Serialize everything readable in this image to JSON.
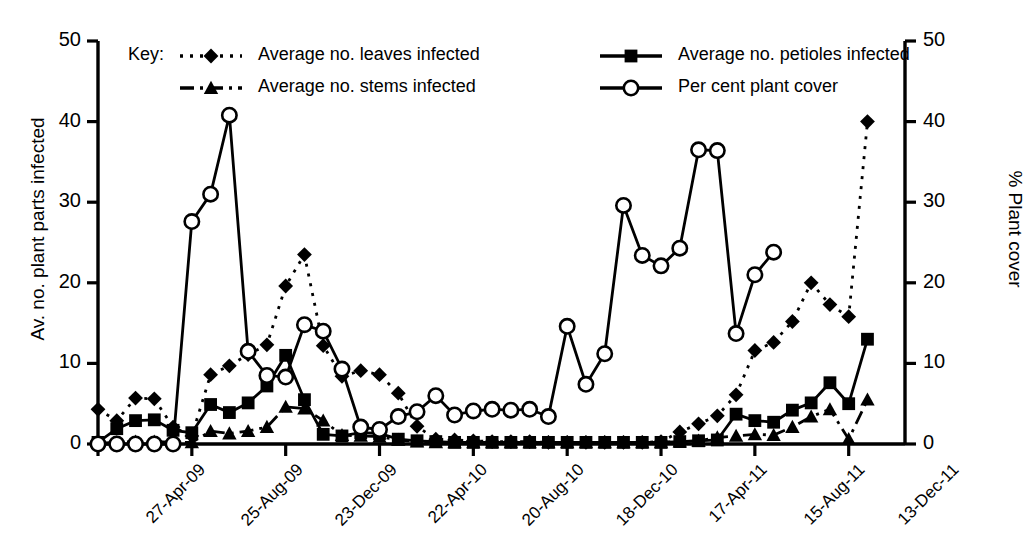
{
  "chart_data": {
    "type": "line",
    "title": "",
    "xlabel": "",
    "ylabel": "Av. no. plant parts infected",
    "y2label": "% Plant cover",
    "ylim": [
      0,
      50
    ],
    "y2lim": [
      0,
      50
    ],
    "yticks": [
      0,
      10,
      20,
      30,
      40,
      50
    ],
    "y2ticks": [
      0,
      10,
      20,
      30,
      40,
      50
    ],
    "grid": false,
    "legend_position": "top-inside",
    "legend_title": "Key:",
    "x_tick_labels": [
      "27-Apr-09",
      "25-Aug-09",
      "23-Dec-09",
      "22-Apr-10",
      "20-Aug-10",
      "18-Dec-10",
      "17-Apr-11",
      "15-Aug-11",
      "13-Dec-11"
    ],
    "x_tick_indices": [
      0,
      5,
      10,
      15,
      20,
      25,
      30,
      35,
      40
    ],
    "n_points": 44,
    "series": [
      {
        "name": "Average no. leaves infected",
        "marker": "diamond",
        "line": "dotted",
        "axis": "left",
        "color": "#000000",
        "values": [
          4.3,
          2.9,
          5.7,
          5.6,
          2.1,
          1.0,
          8.6,
          9.7,
          11.1,
          12.3,
          19.6,
          23.5,
          12.2,
          8.4,
          9.1,
          8.6,
          6.3,
          2.2,
          0.6,
          0.5,
          0.4,
          0.3,
          0.3,
          0.3,
          0.2,
          0.2,
          0.2,
          0.2,
          0.2,
          0.2,
          0.3,
          1.5,
          2.5,
          3.5,
          6.1,
          11.6,
          12.6,
          15.2,
          20.0,
          17.3,
          15.8,
          40.0
        ]
      },
      {
        "name": "Average no. petioles infected",
        "marker": "square",
        "line": "solid",
        "axis": "left",
        "color": "#000000",
        "values": [
          0.2,
          1.9,
          2.9,
          3.0,
          1.7,
          1.4,
          4.9,
          3.9,
          5.1,
          7.2,
          11.0,
          5.5,
          1.2,
          1.0,
          1.4,
          1.3,
          0.6,
          0.4,
          0.3,
          0.2,
          0.2,
          0.2,
          0.2,
          0.2,
          0.2,
          0.2,
          0.2,
          0.2,
          0.2,
          0.2,
          0.2,
          0.3,
          0.4,
          0.5,
          3.7,
          2.9,
          2.7,
          4.2,
          5.1,
          7.6,
          5.0,
          13.0
        ]
      },
      {
        "name": "Average no. stems infected",
        "marker": "triangle",
        "line": "dash-dot",
        "axis": "left",
        "color": "#000000",
        "values": [
          0.1,
          0.2,
          0.3,
          0.3,
          0.2,
          0.2,
          1.6,
          1.3,
          1.6,
          2.1,
          4.6,
          4.4,
          2.9,
          1.1,
          1.0,
          0.9,
          0.5,
          0.3,
          0.2,
          0.2,
          0.2,
          0.2,
          0.2,
          0.2,
          0.2,
          0.2,
          0.2,
          0.2,
          0.2,
          0.2,
          0.2,
          0.3,
          0.4,
          0.8,
          1.0,
          1.2,
          1.1,
          2.1,
          3.4,
          4.3,
          0.6,
          5.5
        ]
      },
      {
        "name": "Per cent plant cover",
        "marker": "circle-open",
        "line": "solid",
        "axis": "right",
        "color": "#000000",
        "values": [
          0.0,
          0.0,
          0.0,
          0.0,
          0.0,
          27.6,
          31.0,
          40.8,
          11.5,
          8.5,
          8.3,
          14.8,
          14.0,
          9.3,
          2.1,
          1.8,
          3.4,
          4.0,
          6.0,
          3.6,
          4.1,
          4.3,
          4.2,
          4.3,
          3.4,
          14.6,
          7.4,
          11.2,
          29.6,
          23.4,
          22.1,
          24.3,
          36.5,
          36.4,
          13.7,
          21.0,
          23.8
        ]
      }
    ]
  },
  "legend": {
    "key_label": "Key:",
    "entries": [
      {
        "label": "Average no. leaves infected",
        "marker": "diamond",
        "line": "dotted"
      },
      {
        "label": "Average no. petioles infected",
        "marker": "square",
        "line": "solid"
      },
      {
        "label": "Average no. stems infected",
        "marker": "triangle",
        "line": "dash-dot"
      },
      {
        "label": "Per cent plant cover",
        "marker": "circle-open",
        "line": "solid"
      }
    ]
  },
  "axes": {
    "left_title": "Av. no. plant parts infected",
    "right_title": "% Plant cover"
  }
}
